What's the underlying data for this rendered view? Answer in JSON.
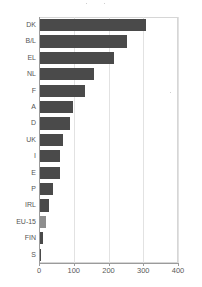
{
  "chart_data": {
    "type": "bar",
    "orientation": "horizontal",
    "title": "",
    "xlabel": "",
    "ylabel": "",
    "categories": [
      "DK",
      "B/L",
      "EL",
      "NL",
      "F",
      "A",
      "D",
      "UK",
      "I",
      "E",
      "P",
      "IRL",
      "EU-15",
      "FIN",
      "S"
    ],
    "values": [
      305,
      250,
      212,
      155,
      130,
      95,
      85,
      65,
      58,
      58,
      37,
      27,
      18,
      8,
      4
    ],
    "series": [
      {
        "name": "value",
        "values": [
          305,
          250,
          212,
          155,
          130,
          95,
          85,
          65,
          58,
          58,
          37,
          27,
          18,
          8,
          4
        ]
      }
    ],
    "xlim": [
      0,
      400
    ],
    "xticks": [
      0,
      100,
      200,
      300,
      400
    ],
    "xtick_labels": [
      "0",
      "100",
      "200",
      "300",
      "400"
    ],
    "grid": "vertical",
    "legend": "none",
    "highlight_category": "EU-15",
    "colors": {
      "bar": "#4a4a4a",
      "bar_highlight": "#8e8e8e",
      "grid": "#e2e2e2",
      "axis": "#9b9b9b",
      "text": "#555555",
      "background": "#ffffff"
    }
  }
}
